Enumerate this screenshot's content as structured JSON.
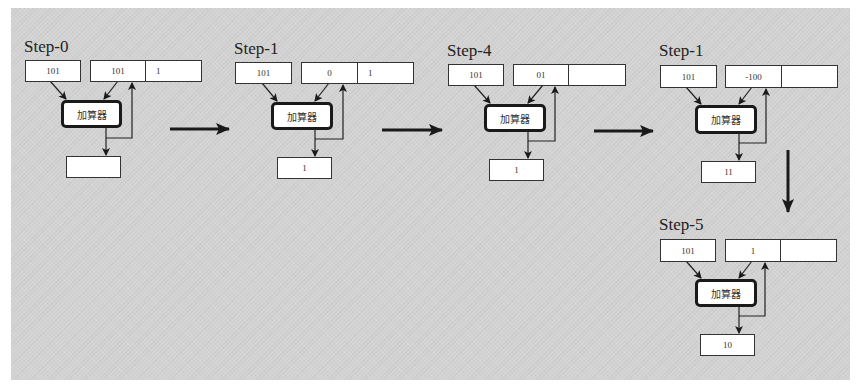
{
  "diagram": {
    "colors": {
      "background": "#d3d3d3",
      "box_fill": "#ffffff",
      "stroke": "#1a1a1a"
    },
    "adder_label": "加算器",
    "steps": [
      {
        "title": "Step-0",
        "input_a": "101",
        "register_high": "101",
        "register_low": "1",
        "output": ""
      },
      {
        "title": "Step-1",
        "input_a": "101",
        "register_high": "0",
        "register_low": "1",
        "output": "1"
      },
      {
        "title": "Step-4",
        "input_a": "101",
        "register_high": "01",
        "register_low": "",
        "output": "1"
      },
      {
        "title": "Step-1",
        "input_a": "101",
        "register_high": "-100",
        "register_low": "",
        "output": "11"
      },
      {
        "title": "Step-5",
        "input_a": "101",
        "register_high": "1",
        "register_low": "",
        "output": "10"
      }
    ],
    "flow_arrows": [
      {
        "from": "Step-0",
        "to": "Step-1",
        "direction": "right"
      },
      {
        "from": "Step-1",
        "to": "Step-4",
        "direction": "right"
      },
      {
        "from": "Step-4",
        "to": "Step-1 (4th)",
        "direction": "right"
      },
      {
        "from": "Step-1 (4th)",
        "to": "Step-5",
        "direction": "down"
      }
    ]
  }
}
